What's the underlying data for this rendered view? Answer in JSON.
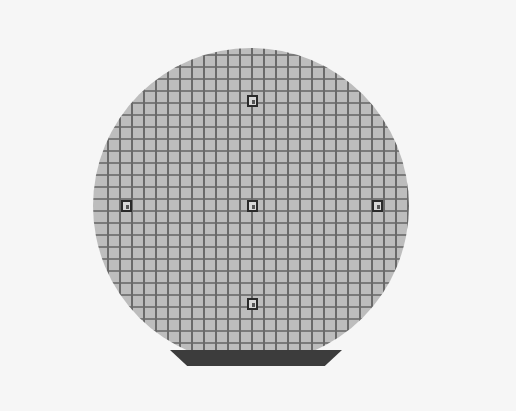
{
  "image": {
    "subject": "silicon wafer with die grid",
    "wafer": {
      "center": [
        251,
        206
      ],
      "radius": 158,
      "die_pitch_px": 12,
      "color": "#bdbdbd",
      "grid_line_color": "#6a6a6a"
    },
    "flat_band": {
      "color": "#3c3c3c"
    },
    "background": "#f6f6f6",
    "markers": [
      {
        "name": "top",
        "x": 247,
        "y": 95
      },
      {
        "name": "left",
        "x": 121,
        "y": 200
      },
      {
        "name": "center",
        "x": 247,
        "y": 200
      },
      {
        "name": "right",
        "x": 372,
        "y": 200
      },
      {
        "name": "bottom",
        "x": 247,
        "y": 298
      }
    ]
  }
}
